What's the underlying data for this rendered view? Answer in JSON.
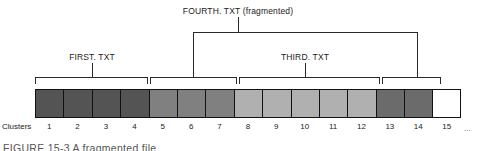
{
  "figure": {
    "caption": "FIGURE 15-3   A fragmented file",
    "clusters_axis_label": "Clusters",
    "ellipsis": "..."
  },
  "labels": {
    "first": "FIRST. TXT",
    "third": "THIRD. TXT",
    "fourth": "FOURTH. TXT (fragmented)"
  },
  "colors": {
    "dark_gray": "#545454",
    "medium_gray": "#808080",
    "light_gray": "#b0b0b0",
    "empty": "#ffffff",
    "line": "#2b2b2b",
    "border": "#111111"
  },
  "chart_data": {
    "type": "diagram",
    "title": "A fragmented file",
    "cluster_numbers": [
      "1",
      "2",
      "3",
      "4",
      "5",
      "6",
      "7",
      "8",
      "9",
      "10",
      "11",
      "12",
      "13",
      "14",
      "15"
    ],
    "clusters": [
      {
        "number": "1",
        "file": "FIRST. TXT",
        "shade": "dark_gray",
        "color": "#545454"
      },
      {
        "number": "2",
        "file": "FIRST. TXT",
        "shade": "dark_gray",
        "color": "#545454"
      },
      {
        "number": "3",
        "file": "FIRST. TXT",
        "shade": "dark_gray",
        "color": "#545454"
      },
      {
        "number": "4",
        "file": "FIRST. TXT",
        "shade": "dark_gray",
        "color": "#545454"
      },
      {
        "number": "5",
        "file": "FOURTH. TXT",
        "shade": "medium_gray",
        "color": "#808080"
      },
      {
        "number": "6",
        "file": "FOURTH. TXT",
        "shade": "medium_gray",
        "color": "#808080"
      },
      {
        "number": "7",
        "file": "FOURTH. TXT",
        "shade": "medium_gray",
        "color": "#808080"
      },
      {
        "number": "8",
        "file": "THIRD. TXT",
        "shade": "light_gray",
        "color": "#b0b0b0"
      },
      {
        "number": "9",
        "file": "THIRD. TXT",
        "shade": "light_gray",
        "color": "#b0b0b0"
      },
      {
        "number": "10",
        "file": "THIRD. TXT",
        "shade": "light_gray",
        "color": "#b0b0b0"
      },
      {
        "number": "11",
        "file": "THIRD. TXT",
        "shade": "light_gray",
        "color": "#b0b0b0"
      },
      {
        "number": "12",
        "file": "THIRD. TXT",
        "shade": "light_gray",
        "color": "#b0b0b0"
      },
      {
        "number": "13",
        "file": "FOURTH. TXT",
        "shade": "dark_gray",
        "color": "#6b6b6b"
      },
      {
        "number": "14",
        "file": "FOURTH. TXT",
        "shade": "dark_gray",
        "color": "#6b6b6b"
      },
      {
        "number": "15",
        "file": "",
        "shade": "empty",
        "color": "#ffffff"
      }
    ],
    "brackets": [
      {
        "label": "FIRST. TXT",
        "clusters": [
          "1",
          "4"
        ],
        "level": "lower"
      },
      {
        "label": "FOURTH. TXT (fragment 1)",
        "clusters": [
          "5",
          "7"
        ],
        "level": "lower"
      },
      {
        "label": "THIRD. TXT",
        "clusters": [
          "8",
          "12"
        ],
        "level": "lower"
      },
      {
        "label": "FOURTH. TXT (fragment 2)",
        "clusters": [
          "13",
          "14"
        ],
        "level": "lower"
      }
    ]
  }
}
